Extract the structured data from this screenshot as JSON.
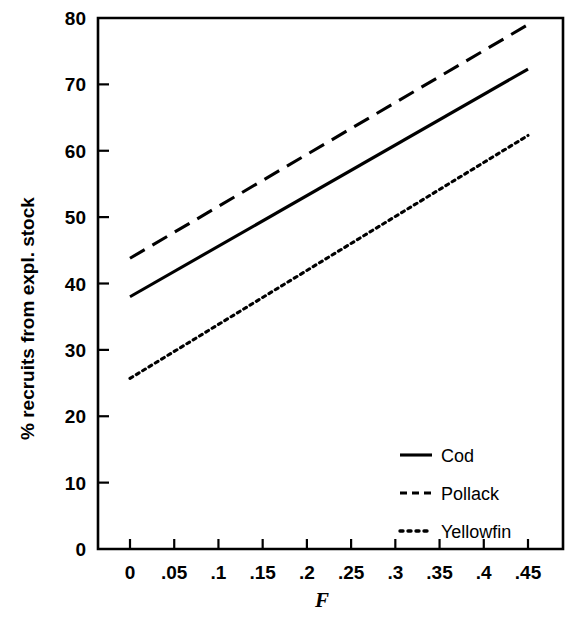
{
  "chart_data": {
    "type": "line",
    "title": "",
    "xlabel": "F",
    "ylabel": "% recruits from expl. stock",
    "xlim": [
      0,
      0.45
    ],
    "ylim": [
      0,
      80
    ],
    "grid": false,
    "legend_position": "inside-lower-right",
    "x_ticks": [
      "0",
      ".05",
      ".1",
      ".15",
      ".2",
      ".25",
      ".3",
      ".35",
      ".4",
      ".45"
    ],
    "x_tick_values": [
      0,
      0.05,
      0.1,
      0.15,
      0.2,
      0.25,
      0.3,
      0.35,
      0.4,
      0.45
    ],
    "y_ticks": [
      "0",
      "10",
      "20",
      "30",
      "40",
      "50",
      "60",
      "70",
      "80"
    ],
    "y_tick_values": [
      0,
      10,
      20,
      30,
      40,
      50,
      60,
      70,
      80
    ],
    "x": [
      0,
      0.45
    ],
    "series": [
      {
        "name": "Cod",
        "style": "solid",
        "values": [
          38.0,
          72.3
        ]
      },
      {
        "name": "Pollack",
        "style": "dashed",
        "values": [
          43.8,
          79.0
        ]
      },
      {
        "name": "Yellowfin",
        "style": "dotted",
        "values": [
          25.7,
          62.3
        ]
      }
    ]
  },
  "legend": {
    "entries": [
      {
        "label": "Cod",
        "style": "solid"
      },
      {
        "label": "Pollack",
        "style": "dashed"
      },
      {
        "label": "Yellowfin",
        "style": "dotted"
      }
    ]
  },
  "axes": {
    "x_title": "F",
    "y_title": "% recruits from expl. stock"
  }
}
